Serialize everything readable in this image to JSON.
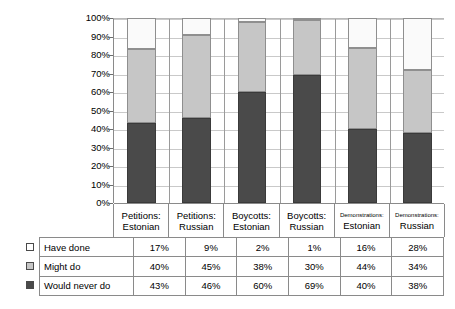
{
  "chart_data": {
    "type": "bar",
    "title": "",
    "xlabel": "",
    "ylabel": "",
    "ylim": [
      0,
      100
    ],
    "grid": true,
    "stacked": true,
    "legend_position": "table-left",
    "categories": [
      "Petitions: Estonian",
      "Petitions: Russian",
      "Boycotts: Estonian",
      "Boycotts: Russian",
      "Demonstrations: Estonian",
      "Demonstrations: Russian"
    ],
    "category_lines": [
      {
        "line1": "Petitions:",
        "line2": "Estonian",
        "small": false
      },
      {
        "line1": "Petitions:",
        "line2": "Russian",
        "small": false
      },
      {
        "line1": "Boycotts:",
        "line2": "Estonian",
        "small": false
      },
      {
        "line1": "Boycotts:",
        "line2": "Russian",
        "small": false
      },
      {
        "line1": "Demonstrations:",
        "line2": "Estonian",
        "small": true
      },
      {
        "line1": "Demonstrations:",
        "line2": "Russian",
        "small": true
      }
    ],
    "series": [
      {
        "name": "Have done",
        "color": "#fafafa",
        "values": [
          17,
          9,
          2,
          1,
          16,
          28
        ]
      },
      {
        "name": "Might do",
        "color": "#c6c6c6",
        "values": [
          40,
          45,
          38,
          30,
          44,
          34
        ]
      },
      {
        "name": "Would never do",
        "color": "#4a4a4a",
        "values": [
          43,
          46,
          60,
          69,
          40,
          38
        ]
      }
    ],
    "y_ticks": [
      "0%",
      "10%",
      "20%",
      "30%",
      "40%",
      "50%",
      "60%",
      "70%",
      "80%",
      "90%",
      "100%"
    ]
  },
  "table": {
    "column_headers": [
      "Petitions: Estonian",
      "Petitions: Russian",
      "Boycotts: Estonian",
      "Boycotts: Russian",
      "Demonstrations: Estonian",
      "Demonstrations: Russian"
    ],
    "rows": [
      {
        "label": "Have done",
        "swatch": "have",
        "values": [
          "17%",
          "9%",
          "2%",
          "1%",
          "16%",
          "28%"
        ]
      },
      {
        "label": "Might do",
        "swatch": "might",
        "values": [
          "40%",
          "45%",
          "38%",
          "30%",
          "44%",
          "34%"
        ]
      },
      {
        "label": "Would never do",
        "swatch": "never",
        "values": [
          "43%",
          "46%",
          "60%",
          "69%",
          "40%",
          "38%"
        ]
      }
    ]
  },
  "colors": {
    "have_done": "#fafafa",
    "might_do": "#c6c6c6",
    "would_never_do": "#4a4a4a",
    "gridline": "#c9c9c9",
    "axis": "#8a8a8a"
  }
}
